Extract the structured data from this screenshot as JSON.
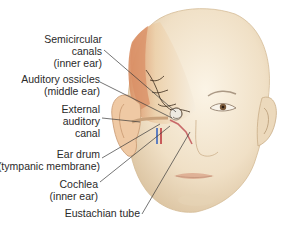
{
  "figure": {
    "labels": [
      {
        "id": "semicircular",
        "lines": [
          "Semicircular",
          "canals",
          "(inner ear)"
        ]
      },
      {
        "id": "ossicles",
        "lines": [
          "Auditory ossicles",
          "(middle ear)"
        ]
      },
      {
        "id": "canal",
        "lines": [
          "External",
          "auditory",
          "canal"
        ]
      },
      {
        "id": "eardrum",
        "lines": [
          "Ear drum",
          "(tympanic membrane)"
        ]
      },
      {
        "id": "cochlea",
        "lines": [
          "Cochlea",
          "(inner ear)"
        ]
      },
      {
        "id": "eustachian",
        "lines": [
          "Eustachian tube"
        ]
      }
    ]
  },
  "colors": {
    "skin": "#f1e3cc",
    "skin_shadow": "#dcc4a2",
    "skull_cut": "#e9c9a6",
    "muscle": "#d98f66",
    "nerve": "#3a2a1a",
    "vein_blue": "#5f7fc0",
    "artery_red": "#c85a5a",
    "leader_line": "#3a3a3a",
    "text": "#2a2a2a"
  }
}
